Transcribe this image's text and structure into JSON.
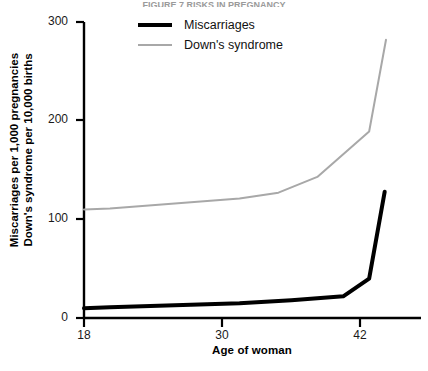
{
  "figure": {
    "cut_off_header": "FIGURE 7  RISKS IN PREGNANCY",
    "background_color": "#ffffff"
  },
  "legend": {
    "position": "top-center",
    "entries": [
      {
        "label": "Miscarriages",
        "color": "#000000",
        "style": "thick",
        "icon": "line-swatch-icon"
      },
      {
        "label": "Down's syndrome",
        "color": "#a8a8a8",
        "style": "thin",
        "icon": "line-swatch-icon"
      }
    ]
  },
  "axes": {
    "x": {
      "title": "Age of woman",
      "ticks": [
        "18",
        "30",
        "42"
      ],
      "tick_values": [
        18,
        30,
        42
      ],
      "range": [
        18,
        44
      ]
    },
    "y": {
      "title_line1": "Miscarriages per 1,000 pregnancies",
      "title_line2": "Down's syndrome per 10,000 births",
      "ticks": [
        "0",
        "100",
        "200",
        "300"
      ],
      "tick_values": [
        0,
        100,
        200,
        300
      ],
      "range": [
        0,
        300
      ]
    }
  },
  "chart_data": {
    "type": "line",
    "title": "FIGURE 7  RISKS IN PREGNANCY",
    "xlabel": "Age of woman",
    "ylabel": "Miscarriages per 1,000 pregnancies / Down's syndrome per 10,000 births",
    "xlim": [
      18,
      44
    ],
    "ylim": [
      0,
      300
    ],
    "xticks": [
      18,
      30,
      42
    ],
    "yticks": [
      0,
      100,
      200,
      300
    ],
    "grid": false,
    "legend_position": "top-center",
    "series": [
      {
        "name": "Miscarriages",
        "color": "#000000",
        "linewidth": 4,
        "unit": "per 1,000 pregnancies",
        "x": [
          18,
          20,
          30,
          34,
          38,
          40,
          41.2
        ],
        "values": [
          10,
          11,
          15,
          18,
          22,
          40,
          128
        ]
      },
      {
        "name": "Down's syndrome",
        "color": "#a8a8a8",
        "linewidth": 2,
        "unit": "per 10,000 births",
        "x": [
          18,
          20,
          30,
          33,
          36,
          40,
          41.3
        ],
        "values": [
          110,
          111,
          121,
          127,
          143,
          189,
          282
        ]
      }
    ]
  }
}
